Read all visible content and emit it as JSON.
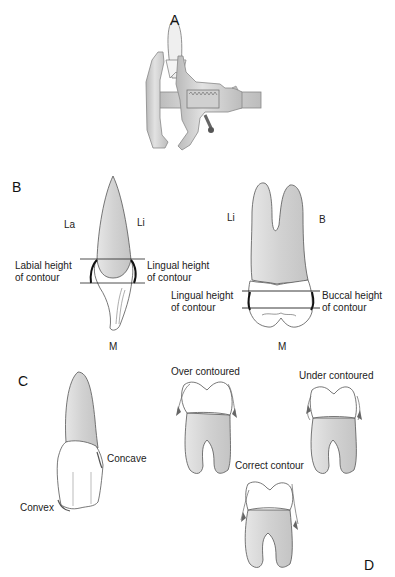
{
  "figure": {
    "panels": {
      "a": "A",
      "b": "B",
      "c": "C",
      "d": "D"
    },
    "panel_b": {
      "incisor": {
        "side_left": "La",
        "side_right": "Li",
        "bottom": "M",
        "label_left_line1": "Labial height",
        "label_left_line2": "of contour",
        "label_right_line1": "Lingual height",
        "label_right_line2": "of contour"
      },
      "molar": {
        "side_left": "Li",
        "side_right": "B",
        "bottom": "M",
        "label_left_line1": "Lingual height",
        "label_left_line2": "of contour",
        "label_right_line1": "Buccal height",
        "label_right_line2": "of contour"
      }
    },
    "panel_c": {
      "concave": "Concave",
      "convex": "Convex"
    },
    "panel_d": {
      "over": "Over contoured",
      "under": "Under contoured",
      "correct": "Correct contour"
    },
    "colors": {
      "outline": "#4a4a4a",
      "root_fill": "#d9d9d9",
      "crown_fill": "#ffffff",
      "instrument": "#c8c8c8",
      "contour_line": "#111111"
    }
  }
}
